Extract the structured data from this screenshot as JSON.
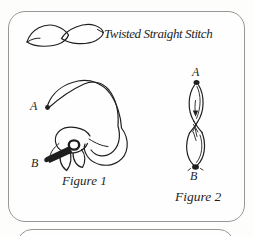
{
  "colors": {
    "ink": "#1f1f1f",
    "border": "#979797",
    "paper": "#fdfdfc",
    "card": "#fefefe"
  },
  "header": {
    "title": "Twisted Straight Stitch"
  },
  "figures": [
    {
      "caption": "Figure 1",
      "points": {
        "a": "A",
        "b": "B"
      }
    },
    {
      "caption": "Figure 2",
      "points": {
        "a": "A",
        "b": "B"
      }
    }
  ]
}
